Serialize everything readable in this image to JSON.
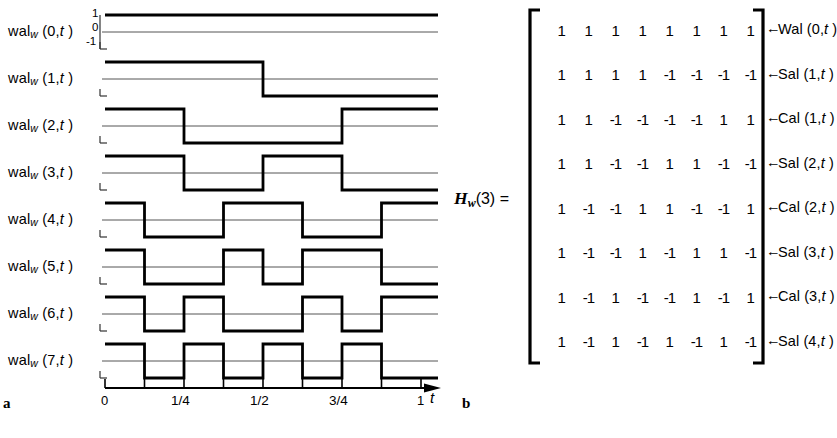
{
  "figure": {
    "panel_a_letter": "a",
    "panel_b_letter": "b"
  },
  "panel_a": {
    "y_axis_labels": {
      "top": "1",
      "mid": "0",
      "bottom": "-1"
    },
    "rows": [
      {
        "name": "wal",
        "sub": "w",
        "index": "0",
        "var": "t",
        "label": "wal_w (0,t)",
        "pattern": [
          1,
          1,
          1,
          1,
          1,
          1,
          1,
          1
        ]
      },
      {
        "name": "wal",
        "sub": "w",
        "index": "1",
        "var": "t",
        "label": "wal_w (1,t)",
        "pattern": [
          1,
          1,
          1,
          1,
          -1,
          -1,
          -1,
          -1
        ]
      },
      {
        "name": "wal",
        "sub": "w",
        "index": "2",
        "var": "t",
        "label": "wal_w (2,t)",
        "pattern": [
          1,
          1,
          -1,
          -1,
          -1,
          -1,
          1,
          1
        ]
      },
      {
        "name": "wal",
        "sub": "w",
        "index": "3",
        "var": "t",
        "label": "wal_w (3,t)",
        "pattern": [
          1,
          1,
          -1,
          -1,
          1,
          1,
          -1,
          -1
        ]
      },
      {
        "name": "wal",
        "sub": "w",
        "index": "4",
        "var": "t",
        "label": "wal_w (4,t)",
        "pattern": [
          1,
          -1,
          -1,
          1,
          1,
          -1,
          -1,
          1
        ]
      },
      {
        "name": "wal",
        "sub": "w",
        "index": "5",
        "var": "t",
        "label": "wal_w (5,t)",
        "pattern": [
          1,
          -1,
          -1,
          1,
          -1,
          1,
          1,
          -1
        ]
      },
      {
        "name": "wal",
        "sub": "w",
        "index": "6",
        "var": "t",
        "label": "wal_w (6,t)",
        "pattern": [
          1,
          -1,
          1,
          -1,
          -1,
          1,
          -1,
          1
        ]
      },
      {
        "name": "wal",
        "sub": "w",
        "index": "7",
        "var": "t",
        "label": "wal_w (7,t)",
        "pattern": [
          1,
          -1,
          1,
          -1,
          1,
          -1,
          1,
          -1
        ]
      }
    ],
    "x_axis": {
      "variable": "t",
      "tick_values": [
        0,
        0.125,
        0.25,
        0.375,
        0.5,
        0.625,
        0.75,
        0.875,
        1
      ],
      "tick_labels": [
        "0",
        "",
        "1/4",
        "",
        "1/2",
        "",
        "3/4",
        "",
        "1"
      ],
      "labeled_ticks": [
        {
          "value": 0,
          "text": "0"
        },
        {
          "value": 0.25,
          "text": "1/4"
        },
        {
          "value": 0.5,
          "text": "1/2"
        },
        {
          "value": 0.75,
          "text": "3/4"
        },
        {
          "value": 1,
          "text": "1"
        }
      ]
    }
  },
  "panel_b": {
    "matrix_name": "H",
    "matrix_name_sub": "w",
    "matrix_arg": "(3) =",
    "matrix_label_full": "H_w(3) =",
    "matrix": [
      [
        1,
        1,
        1,
        1,
        1,
        1,
        1,
        1
      ],
      [
        1,
        1,
        1,
        1,
        -1,
        -1,
        -1,
        -1
      ],
      [
        1,
        1,
        -1,
        -1,
        -1,
        -1,
        1,
        1
      ],
      [
        1,
        1,
        -1,
        -1,
        1,
        1,
        -1,
        -1
      ],
      [
        1,
        -1,
        -1,
        1,
        1,
        -1,
        -1,
        1
      ],
      [
        1,
        -1,
        -1,
        1,
        -1,
        1,
        1,
        -1
      ],
      [
        1,
        -1,
        1,
        -1,
        -1,
        1,
        -1,
        1
      ],
      [
        1,
        -1,
        1,
        -1,
        1,
        -1,
        1,
        -1
      ]
    ],
    "row_annotations": [
      "Wal (0,t)",
      "Sal (1,t)",
      "Cal (1,t)",
      "Sal (2,t)",
      "Cal (2,t)",
      "Sal (3,t)",
      "Cal (3,t)",
      "Sal (4,t)"
    ],
    "row_annotation_parts": [
      {
        "func": "Wal",
        "order": "0",
        "var": "t"
      },
      {
        "func": "Sal",
        "order": "1",
        "var": "t"
      },
      {
        "func": "Cal",
        "order": "1",
        "var": "t"
      },
      {
        "func": "Sal",
        "order": "2",
        "var": "t"
      },
      {
        "func": "Cal",
        "order": "2",
        "var": "t"
      },
      {
        "func": "Sal",
        "order": "3",
        "var": "t"
      },
      {
        "func": "Cal",
        "order": "3",
        "var": "t"
      },
      {
        "func": "Sal",
        "order": "4",
        "var": "t"
      }
    ]
  },
  "colors": {
    "ink": "#000000",
    "paper": "#ffffff",
    "baseline": "#555555"
  }
}
